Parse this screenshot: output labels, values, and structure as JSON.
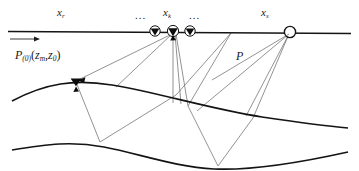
{
  "figure": {
    "width": 359,
    "height": 171,
    "background": "#ffffff",
    "line_color": "#141414",
    "ray_color": "#6f6f6f"
  },
  "labels": {
    "receiver_coord": {
      "base": "x",
      "sub": "r"
    },
    "trace_coord": {
      "base": "x",
      "sub": "k"
    },
    "source_coord": {
      "base": "x",
      "sub": "s"
    },
    "wavefield_P": "P",
    "wavefield_P0": {
      "base": "P",
      "sub": "(0)",
      "args_open": "(",
      "arg1_base": "z",
      "arg1_sub": "m",
      "comma": ",",
      "arg2_base": "z",
      "arg2_sub": "0",
      "args_close": ")"
    },
    "ellipsis_left": "...",
    "ellipsis_right": "..."
  },
  "markers": {
    "geophones": [
      {
        "name": "geophone-left",
        "x": 155,
        "y": 33
      },
      {
        "name": "geophone-center",
        "x": 173,
        "y": 33
      },
      {
        "name": "geophone-right",
        "x": 190,
        "y": 33
      }
    ],
    "source": {
      "name": "source-marker",
      "x": 290,
      "y": 32,
      "r": 5.5
    },
    "subsurface_receiver": {
      "name": "subsurface-geophone",
      "x": 76,
      "y": 81
    },
    "direction_arrow": {
      "x1": 10,
      "y1": 39,
      "x2": 36,
      "y2": 39
    }
  },
  "interfaces": {
    "surface": "M 8,31 L 351,33",
    "reflector_1": "M 12,101 C 46,83 74,79 112,85 C 160,93 210,109 262,117 C 296,122 326,126 348,128",
    "reflector_2": "M 12,150 C 48,144 72,141 104,147 C 140,154 176,167 214,169 C 258,171 312,160 348,152"
  },
  "rays": [
    {
      "name": "ray-xr-to-subsurface-down",
      "points": "172,34 76,81"
    },
    {
      "name": "ray-xk-direct-down",
      "points": "173,34 173,103"
    },
    {
      "name": "ray-xk-bounce-a",
      "points": "173,34 180,104"
    },
    {
      "name": "ray-xk-bounce-b",
      "points": "173,34 186,106"
    },
    {
      "name": "ray-xk-left-leg",
      "points": "173,34 116,87"
    },
    {
      "name": "ray-left-deep-v",
      "points": "76,82 100,142"
    },
    {
      "name": "ray-left-deep-up",
      "points": "100,142 174,95"
    },
    {
      "name": "ray-mid-reflection-1",
      "points": "174,95 230,33"
    },
    {
      "name": "ray-mid-reflection-2",
      "points": "230,33 186,106"
    },
    {
      "name": "ray-mid-deep-down",
      "points": "186,106 218,165"
    },
    {
      "name": "ray-mid-deep-up",
      "points": "218,165 252,117"
    },
    {
      "name": "ray-source-leg-1",
      "points": "290,33 252,117"
    },
    {
      "name": "ray-source-leg-2",
      "points": "290,33 246,116"
    },
    {
      "name": "ray-source-leg-3",
      "points": "290,33 196,110"
    },
    {
      "name": "ray-source-to-P",
      "points": "290,33 212,80"
    }
  ],
  "arrowheads": [
    {
      "name": "arrowhead-subsurface",
      "x": 79,
      "y": 80,
      "angle": 207
    },
    {
      "name": "arrowhead-surface-xk",
      "x": 174,
      "y": 36,
      "angle": 65
    }
  ]
}
